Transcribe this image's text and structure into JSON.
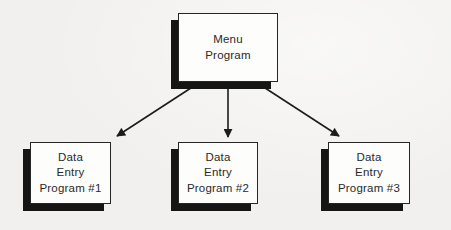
{
  "theme": {
    "bg": "#f1f0ee",
    "box_fill": "#fdfdfc",
    "box_border": "#262626",
    "shadow": "#151515",
    "line": "#1c1c1c",
    "text": "#2a2a2a"
  },
  "diagram": {
    "type": "hierarchy-flowchart",
    "nodes": {
      "menu": {
        "label": "Menu\nProgram"
      },
      "entry1": {
        "label": "Data\nEntry\nProgram #1"
      },
      "entry2": {
        "label": "Data\nEntry\nProgram #2"
      },
      "entry3": {
        "label": "Data\nEntry\nProgram #3"
      }
    },
    "edges": [
      {
        "from": "menu",
        "to": "entry1"
      },
      {
        "from": "menu",
        "to": "entry2"
      },
      {
        "from": "menu",
        "to": "entry3"
      }
    ]
  }
}
